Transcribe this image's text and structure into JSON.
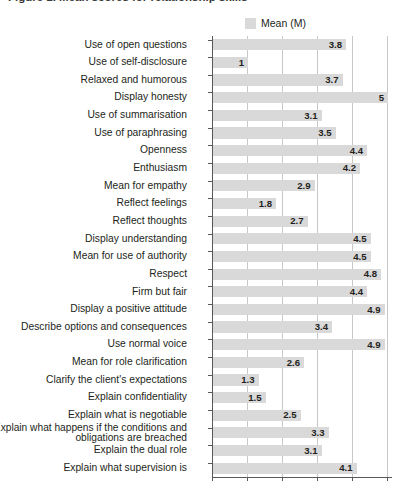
{
  "figure": {
    "title_fragment": "Figure 1. Mean scores for relationship skills"
  },
  "legend": {
    "label": "Mean (M)",
    "swatch_color": "#d9d9d9"
  },
  "colors": {
    "bar": "#d9d9d9",
    "gridline": "#c8c8c8",
    "axis": "#58595b",
    "text": "#231f20",
    "background": "#ffffff"
  },
  "chart_data": {
    "type": "bar",
    "orientation": "horizontal",
    "title": "",
    "xlabel": "",
    "ylabel": "",
    "xlim": [
      0,
      5.15
    ],
    "ticks": [
      0,
      1,
      2,
      3,
      4,
      5
    ],
    "grid": true,
    "legend_position": "top",
    "series": [
      {
        "name": "Mean (M)",
        "values": [
          3.8,
          1,
          3.7,
          5,
          3.1,
          3.5,
          4.4,
          4.2,
          2.9,
          1.8,
          2.7,
          4.5,
          4.5,
          4.8,
          4.4,
          4.9,
          3.4,
          4.9,
          2.6,
          1.3,
          1.5,
          2.5,
          3.3,
          3.1,
          4.1
        ]
      }
    ],
    "categories": [
      "Use of open questions",
      "Use of self-disclosure",
      "Relaxed and humorous",
      "Display honesty",
      "Use of summarisation",
      "Use of paraphrasing",
      "Openness",
      "Enthusiasm",
      "Mean for empathy",
      "Reflect feelings",
      "Reflect thoughts",
      "Display understanding",
      "Mean for use of authority",
      "Respect",
      "Firm but fair",
      "Display a positive attitude",
      "Describe options and consequences",
      "Use normal voice",
      "Mean for role clarification",
      "Clarify the client's expectations",
      "Explain confidentiality",
      "Explain what is negotiable",
      "Explain what happens if the conditions and obligations are breached",
      "Explain the dual role",
      "Explain what supervision is"
    ],
    "value_labels": [
      "3.8",
      "1",
      "3.7",
      "5",
      "3.1",
      "3.5",
      "4.4",
      "4.2",
      "2.9",
      "1.8",
      "2.7",
      "4.5",
      "4.5",
      "4.8",
      "4.4",
      "4.9",
      "3.4",
      "4.9",
      "2.6",
      "1.3",
      "1.5",
      "2.5",
      "3.3",
      "3.1",
      "4.1"
    ]
  }
}
